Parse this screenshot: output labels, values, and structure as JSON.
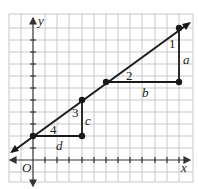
{
  "diagram": {
    "type": "coordinate-grid-line-with-slope-triangles",
    "axes": {
      "x_label": "x",
      "y_label": "y",
      "origin_label": "O"
    },
    "line": {
      "slope": 0.5,
      "passes_through": [
        [
          0,
          1
        ],
        [
          4,
          3
        ],
        [
          6,
          4
        ],
        [
          12,
          7
        ]
      ]
    },
    "points": [
      [
        0,
        1
      ],
      [
        4,
        1
      ],
      [
        4,
        3
      ],
      [
        6,
        4
      ],
      [
        12,
        4
      ],
      [
        12,
        7
      ]
    ],
    "triangles": [
      {
        "angle_label": "1",
        "vertical_label": "a",
        "horizontal_label": "b",
        "angle_label_2": "2"
      },
      {
        "angle_label": "3",
        "vertical_label": "c",
        "horizontal_label": "d",
        "angle_label_2": "4"
      }
    ],
    "labels": {
      "angle1": "1",
      "angle2": "2",
      "angle3": "3",
      "angle4": "4",
      "a": "a",
      "b": "b",
      "c": "c",
      "d": "d",
      "x": "x",
      "y": "y",
      "O": "O"
    },
    "colors": {
      "grid": "#c8c8c8",
      "line": "#1a1a1a",
      "background": "#ffffff"
    }
  }
}
